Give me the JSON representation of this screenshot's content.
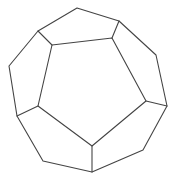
{
  "figure": {
    "stroke_color": "#444444",
    "background": "#ffffff",
    "outer_vertices": [
      [
        77,
        8
      ],
      [
        119,
        21
      ],
      [
        156,
        55
      ],
      [
        167,
        106
      ],
      [
        143,
        150
      ],
      [
        92,
        172
      ],
      [
        43,
        161
      ],
      [
        17,
        116
      ],
      [
        9,
        66
      ],
      [
        38,
        31
      ]
    ],
    "inner_vertices": [
      [
        52,
        45
      ],
      [
        112,
        38
      ],
      [
        146,
        101
      ],
      [
        92,
        146
      ],
      [
        38,
        106
      ]
    ],
    "spokes": [
      [
        [
          38,
          31
        ],
        [
          52,
          45
        ]
      ],
      [
        [
          119,
          21
        ],
        [
          112,
          38
        ]
      ],
      [
        [
          167,
          106
        ],
        [
          146,
          101
        ]
      ],
      [
        [
          92,
          172
        ],
        [
          92,
          146
        ]
      ],
      [
        [
          17,
          116
        ],
        [
          38,
          106
        ]
      ]
    ]
  }
}
